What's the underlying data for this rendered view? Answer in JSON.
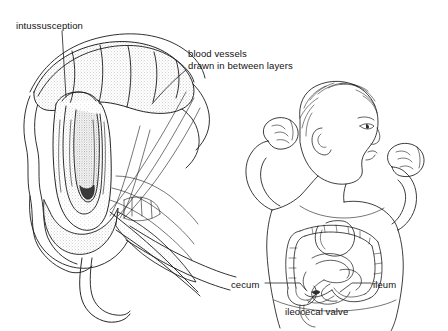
{
  "figure": {
    "title": "Intussusception",
    "background_color": "#ffffff",
    "ink_color": "#1a1a1a",
    "stipple_color": "#8a8a8a",
    "style": "pen-and-ink medical line drawing with stipple shading",
    "panels": [
      {
        "name": "intussusception-cross-section",
        "description": "Cut-away view of bowel telescoping into itself, with mesentery and blood vessels drawn between the layers; appendix tapers off below."
      },
      {
        "name": "infant-body-overview",
        "description": "Line drawing of an infant seen from the front with head in right profile and both fists raised, with the colon and small bowel superimposed on the abdomen."
      }
    ]
  },
  "labels": {
    "intussusception": "intussusception",
    "blood_vessels_line1": "blood vessels",
    "blood_vessels_line2": "drawn in between layers",
    "cecum": "cecum",
    "ileum": "ileum",
    "ileocecal_valve": "ileocecal valve"
  }
}
